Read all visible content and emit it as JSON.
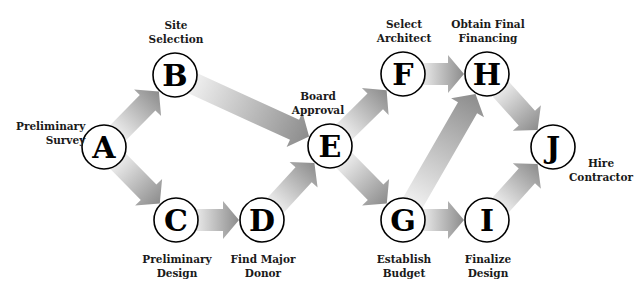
{
  "diagram": {
    "type": "network-flow",
    "nodes": [
      {
        "id": "A",
        "letter": "A",
        "label_lines": [
          "Preliminary",
          "Survey"
        ],
        "cx": 104,
        "cy": 147
      },
      {
        "id": "B",
        "letter": "B",
        "label_lines": [
          "Site",
          "Selection"
        ],
        "cx": 175,
        "cy": 75
      },
      {
        "id": "C",
        "letter": "C",
        "label_lines": [
          "Preliminary",
          "Design"
        ],
        "cx": 176,
        "cy": 220
      },
      {
        "id": "D",
        "letter": "D",
        "label_lines": [
          "Find Major",
          "Donor"
        ],
        "cx": 262,
        "cy": 220
      },
      {
        "id": "E",
        "letter": "E",
        "label_lines": [
          "Board",
          "Approval"
        ],
        "cx": 330,
        "cy": 146
      },
      {
        "id": "F",
        "letter": "F",
        "label_lines": [
          "Select",
          "Architect"
        ],
        "cx": 403,
        "cy": 74
      },
      {
        "id": "G",
        "letter": "G",
        "label_lines": [
          "Establish",
          "Budget"
        ],
        "cx": 403,
        "cy": 220
      },
      {
        "id": "H",
        "letter": "H",
        "label_lines": [
          "Obtain Final",
          "Financing"
        ],
        "cx": 487,
        "cy": 74
      },
      {
        "id": "I",
        "letter": "I",
        "label_lines": [
          "Finalize",
          "Design"
        ],
        "cx": 487,
        "cy": 220
      },
      {
        "id": "J",
        "letter": "J",
        "label_lines": [
          "Hire",
          "Contractor"
        ],
        "cx": 553,
        "cy": 147
      }
    ],
    "edges": [
      {
        "from": "A",
        "to": "B"
      },
      {
        "from": "A",
        "to": "C"
      },
      {
        "from": "B",
        "to": "E"
      },
      {
        "from": "C",
        "to": "D"
      },
      {
        "from": "D",
        "to": "E"
      },
      {
        "from": "E",
        "to": "F"
      },
      {
        "from": "E",
        "to": "G"
      },
      {
        "from": "F",
        "to": "H"
      },
      {
        "from": "G",
        "to": "H"
      },
      {
        "from": "G",
        "to": "I"
      },
      {
        "from": "H",
        "to": "J"
      },
      {
        "from": "I",
        "to": "J"
      }
    ],
    "colors": {
      "arrow_light": "#f2f2f2",
      "arrow_dark": "#8c8c8c",
      "node_fill": "#ffffff",
      "node_stroke": "#000000",
      "text": "#1a1a1a"
    }
  },
  "labels": {
    "A": {
      "line1": "Preliminary",
      "line2": "Survey"
    },
    "B": {
      "line1": "Site",
      "line2": "Selection"
    },
    "C": {
      "line1": "Preliminary",
      "line2": "Design"
    },
    "D": {
      "line1": "Find Major",
      "line2": "Donor"
    },
    "E": {
      "line1": "Board",
      "line2": "Approval"
    },
    "F": {
      "line1": "Select",
      "line2": "Architect"
    },
    "G": {
      "line1": "Establish",
      "line2": "Budget"
    },
    "H": {
      "line1": "Obtain Final",
      "line2": "Financing"
    },
    "I": {
      "line1": "Finalize",
      "line2": "Design"
    },
    "J": {
      "line1": "Hire",
      "line2": "Contractor"
    }
  }
}
